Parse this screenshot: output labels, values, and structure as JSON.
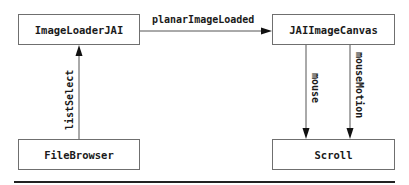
{
  "diagram": {
    "nodes": [
      {
        "id": "image-loader",
        "label": "ImageLoaderJAI"
      },
      {
        "id": "jai-canvas",
        "label": "JAIImageCanvas"
      },
      {
        "id": "file-browser",
        "label": "FileBrowser"
      },
      {
        "id": "scroll",
        "label": "Scroll"
      }
    ],
    "edges": [
      {
        "from": "ImageLoaderJAI",
        "to": "JAIImageCanvas",
        "label": "planarImageLoaded"
      },
      {
        "from": "FileBrowser",
        "to": "ImageLoaderJAI",
        "label": "listSelect"
      },
      {
        "from": "JAIImageCanvas",
        "to": "Scroll",
        "label": "mouse"
      },
      {
        "from": "JAIImageCanvas",
        "to": "Scroll",
        "label": "mouseMotion"
      }
    ],
    "colors": {
      "box_border": "#6f6f6f",
      "line": "#555555",
      "arrowhead": "#111111",
      "text": "#1a1a1a",
      "rule": "#222222"
    }
  }
}
